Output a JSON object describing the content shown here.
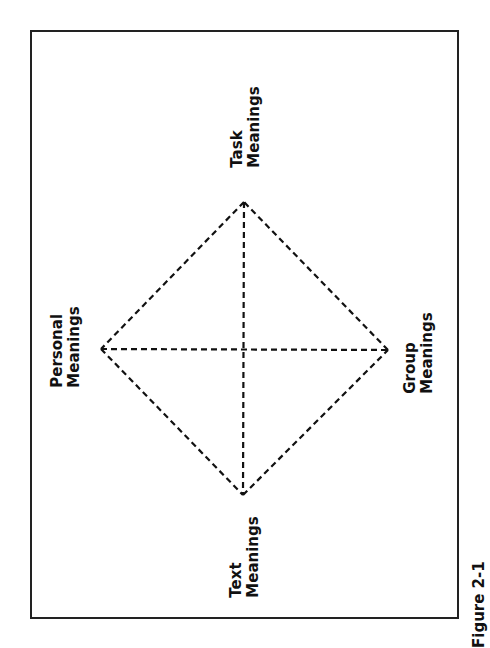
{
  "diagram": {
    "nodes": [
      {
        "id": "task",
        "line1": "Task",
        "line2": "Meanings"
      },
      {
        "id": "personal",
        "line1": "Personal",
        "line2": "Meanings"
      },
      {
        "id": "group",
        "line1": "Group",
        "line2": "Meanings"
      },
      {
        "id": "text",
        "line1": "Text",
        "line2": "Meanings"
      }
    ],
    "edges": [
      [
        "task",
        "personal"
      ],
      [
        "personal",
        "text"
      ],
      [
        "text",
        "group"
      ],
      [
        "group",
        "task"
      ],
      [
        "task",
        "text"
      ],
      [
        "personal",
        "group"
      ]
    ],
    "line_style": "dashed",
    "caption": "Figure 2-1"
  }
}
